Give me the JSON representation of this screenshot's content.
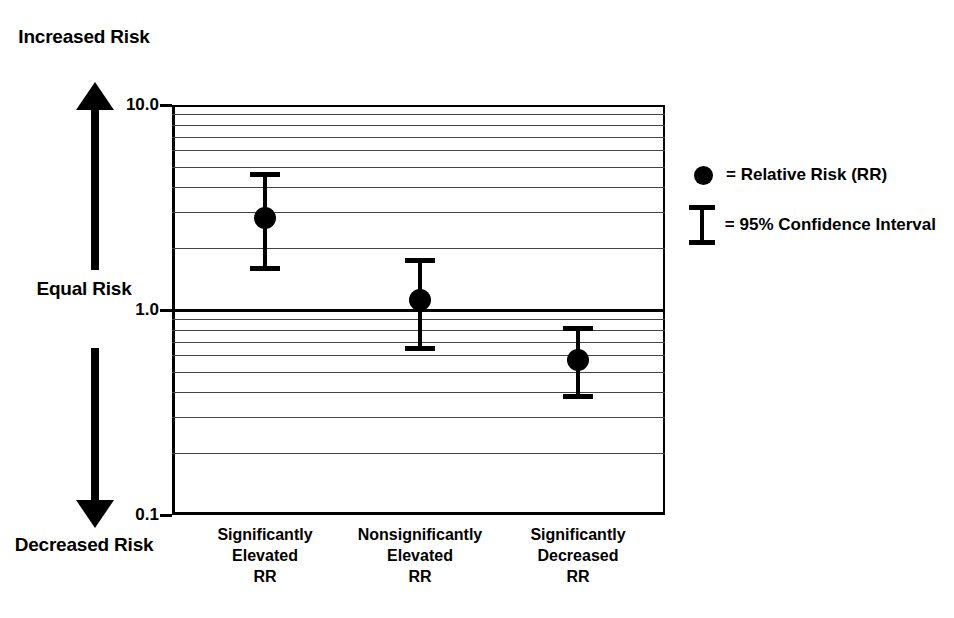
{
  "annotations": {
    "increased_risk": "Increased\nRisk",
    "equal_risk": "Equal\nRisk",
    "decreased_risk": "Decreased\nRisk"
  },
  "legend": {
    "items": [
      {
        "key": "filled-circle",
        "equals": "= Relative Risk (RR)"
      },
      {
        "key": "error-bar",
        "equals": "= 95% Confidence Interval"
      }
    ]
  },
  "chart_data": {
    "type": "scatter",
    "title": "",
    "xlabel": "",
    "ylabel": "",
    "yscale": "log",
    "ylim": [
      0.1,
      10.0
    ],
    "ytick_labels": [
      "10.0",
      "1.0",
      "0.1"
    ],
    "ytick_values": [
      10.0,
      1.0,
      0.1
    ],
    "minor_gridlines": [
      9,
      8,
      7,
      6,
      5,
      4,
      3,
      2,
      0.9,
      0.8,
      0.7,
      0.6,
      0.5,
      0.4,
      0.3,
      0.2
    ],
    "reference_line": 1.0,
    "grid": true,
    "legend_position": "right",
    "categories": [
      "Significantly\nElevated\nRR",
      "Nonsignificantly\nElevated\nRR",
      "Significantly\nDecreased\nRR"
    ],
    "series": [
      {
        "name": "Relative Risk (RR)",
        "values": [
          2.8,
          1.12,
          0.57
        ],
        "ci_low": [
          1.6,
          0.65,
          0.38
        ],
        "ci_high": [
          4.6,
          1.75,
          0.82
        ]
      }
    ],
    "colors": {
      "marker": "#000000",
      "gridline": "#444444",
      "axis": "#000000",
      "reference_line": "#000000"
    }
  }
}
